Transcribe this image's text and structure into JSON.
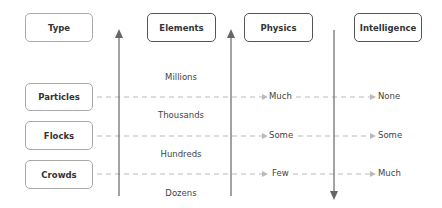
{
  "headers": {
    "type": "Type",
    "elements": "Elements",
    "physics": "Physics",
    "intelligence": "Intelligence"
  },
  "rows": [
    {
      "type": "Particles",
      "physics": "Much",
      "intelligence": "None"
    },
    {
      "type": "Flocks",
      "physics": "Some",
      "intelligence": "Some"
    },
    {
      "type": "Crowds",
      "physics": "Few",
      "intelligence": "Much"
    }
  ],
  "element_scale": [
    "Millions",
    "Thousands",
    "Hundreds",
    "Dozens"
  ],
  "axes": {
    "elements_arrow": "up",
    "physics_arrow": "up",
    "intelligence_arrow": "down"
  },
  "colors": {
    "axis": "#666666",
    "dash": "#bbbbbb",
    "box_border_dark": "#555555",
    "box_border_light": "#aaaaaa"
  }
}
